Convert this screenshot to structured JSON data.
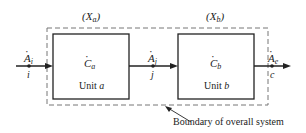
{
  "diagram": {
    "type": "two-unit process flow with overall system boundary",
    "colors": {
      "line": "#222222",
      "boundary": "#777777",
      "background": "#ffffff"
    },
    "units": [
      {
        "id": "a",
        "label": "Unit a",
        "unit_word": "Unit",
        "unit_letter": "a",
        "rate_symbol": "C",
        "rate_subscript": "a",
        "state_label_open": "(",
        "state_symbol": "X",
        "state_subscript": "a",
        "state_label_close": ")"
      },
      {
        "id": "b",
        "label": "Unit b",
        "unit_word": "Unit",
        "unit_letter": "b",
        "rate_symbol": "C",
        "rate_subscript": "b",
        "state_label_open": "(",
        "state_symbol": "X",
        "state_subscript": "b",
        "state_label_close": ")"
      }
    ],
    "streams": [
      {
        "id": "i",
        "flow_symbol": "A",
        "flow_subscript": "i",
        "stream_label": "i",
        "from": "outside",
        "to": "a"
      },
      {
        "id": "j",
        "flow_symbol": "A",
        "flow_subscript": "j",
        "stream_label": "j",
        "from": "a",
        "to": "b"
      },
      {
        "id": "e",
        "flow_symbol": "A",
        "flow_subscript": "e",
        "stream_label": "c",
        "from": "b",
        "to": "outside"
      }
    ],
    "boundary_caption": "Boundary of overall system"
  }
}
